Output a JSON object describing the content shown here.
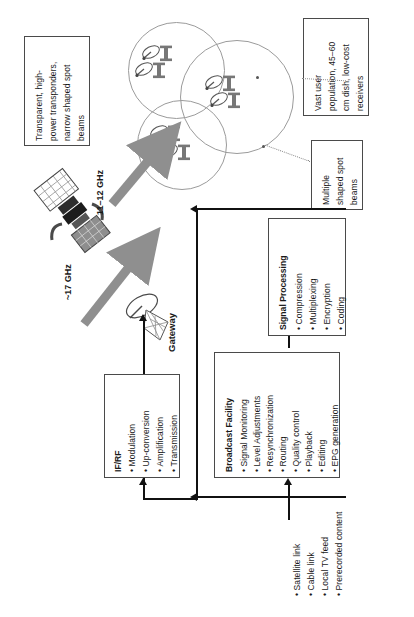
{
  "figure": {
    "orientation": "rotated-90-clockwise",
    "accent_gray": "#8a8a8a",
    "line_color": "#111111",
    "box_border": "#4a4a4a"
  },
  "callouts": [
    {
      "id": "transponder-callout",
      "lines": [
        "Transparent, high-",
        "power transponders,",
        "narrow shaped spot",
        "beams"
      ]
    },
    {
      "id": "user-population-callout",
      "lines": [
        "Vast user",
        "population, 45–60",
        "cm dish, low-cost",
        "receivers"
      ]
    },
    {
      "id": "spot-beams-callout",
      "lines": [
        "Multiple",
        "shaped spot",
        "beams"
      ]
    }
  ],
  "frequency_labels": [
    {
      "id": "downlink",
      "text": "11–12 GHz"
    },
    {
      "id": "uplink",
      "text": "~17 GHz"
    }
  ],
  "gateway": {
    "label": "Gateway"
  },
  "blocks": [
    {
      "id": "if-rf",
      "title": "IF/RF",
      "items": [
        "Modulation",
        "Up-conversion",
        "Amplification",
        "Transmission"
      ]
    },
    {
      "id": "broadcast-facility",
      "title": "Broadcast Facility",
      "items": [
        "Signal Monitoring",
        "Level Adjustments",
        "Resynchronization",
        "Routing",
        "Quality control",
        "Playback",
        "Editing",
        "EPG generation"
      ]
    },
    {
      "id": "signal-processing",
      "title": "Signal Processing",
      "items": [
        "Compression",
        "Multiplexing",
        "Encryption",
        "Coding"
      ]
    }
  ],
  "sources": {
    "id": "content-sources",
    "items": [
      "Satellite link",
      "Cable link",
      "Local TV feed",
      "Prerecorded content"
    ]
  },
  "icons": {
    "satellite": "satellite-icon",
    "dish": "parabolic-dish-icon",
    "tv": "television-icon",
    "gateway_dish": "gateway-dish-icon"
  }
}
